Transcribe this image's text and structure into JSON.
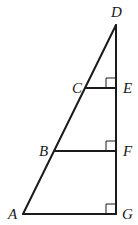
{
  "diagram": {
    "type": "geometry",
    "points": {
      "A": {
        "label": "A",
        "x": 23,
        "y": 214
      },
      "B": {
        "label": "B",
        "x": 55,
        "y": 151
      },
      "C": {
        "label": "C",
        "x": 86,
        "y": 88
      },
      "D": {
        "label": "D",
        "x": 116,
        "y": 25
      },
      "E": {
        "label": "E",
        "x": 116,
        "y": 88
      },
      "F": {
        "label": "F",
        "x": 116,
        "y": 151
      },
      "G": {
        "label": "G",
        "x": 116,
        "y": 214
      }
    },
    "segments": [
      [
        "A",
        "D"
      ],
      [
        "D",
        "G"
      ],
      [
        "A",
        "G"
      ],
      [
        "C",
        "E"
      ],
      [
        "B",
        "F"
      ]
    ],
    "right_angles": [
      "E",
      "F",
      "G"
    ],
    "stroke_color": "#1a1a1a"
  }
}
